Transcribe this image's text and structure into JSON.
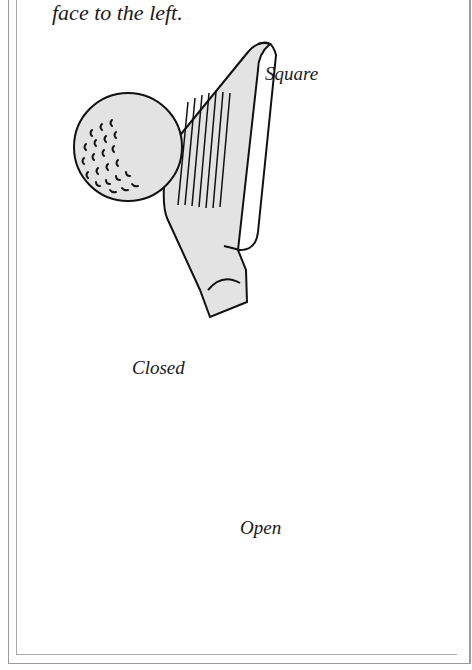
{
  "figure": {
    "caption_tail": "face to the left.",
    "labels": {
      "square": "Square",
      "closed": "Closed",
      "open": "Open"
    },
    "colors": {
      "fill": "#e3e3e3",
      "stroke": "#111111",
      "frame": "#9a9a9a"
    }
  }
}
